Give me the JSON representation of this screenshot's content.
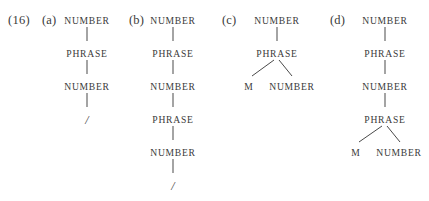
{
  "figure": {
    "example_number": "(16)",
    "background_color": "#ffffff",
    "text_color": "#3a3a3a",
    "line_color": "#4a4a4a",
    "node_labels": {
      "number": "NUMBER",
      "phrase": "PHRASE",
      "m": "M",
      "slash": "/"
    },
    "trees": [
      {
        "label": "(a)",
        "label_x": 42,
        "center_x": 87,
        "nodes": [
          {
            "text": "NUMBER",
            "x": 87,
            "y": 15,
            "type": "nonterminal"
          },
          {
            "text": "PHRASE",
            "x": 87,
            "y": 48,
            "type": "nonterminal"
          },
          {
            "text": "NUMBER",
            "x": 87,
            "y": 81,
            "type": "nonterminal"
          },
          {
            "text": "/",
            "x": 87,
            "y": 113,
            "type": "terminal-slash"
          }
        ],
        "edges": [
          {
            "x": 87,
            "y": 27,
            "height": 14
          },
          {
            "x": 87,
            "y": 60,
            "height": 14
          },
          {
            "x": 87,
            "y": 93,
            "height": 14
          }
        ],
        "branches": []
      },
      {
        "label": "(b)",
        "label_x": 129,
        "center_x": 173,
        "nodes": [
          {
            "text": "NUMBER",
            "x": 173,
            "y": 15,
            "type": "nonterminal"
          },
          {
            "text": "PHRASE",
            "x": 173,
            "y": 48,
            "type": "nonterminal"
          },
          {
            "text": "NUMBER",
            "x": 173,
            "y": 81,
            "type": "nonterminal"
          },
          {
            "text": "PHRASE",
            "x": 173,
            "y": 114,
            "type": "nonterminal"
          },
          {
            "text": "NUMBER",
            "x": 173,
            "y": 147,
            "type": "nonterminal"
          },
          {
            "text": "/",
            "x": 173,
            "y": 179,
            "type": "terminal-slash"
          }
        ],
        "edges": [
          {
            "x": 173,
            "y": 27,
            "height": 14
          },
          {
            "x": 173,
            "y": 60,
            "height": 14
          },
          {
            "x": 173,
            "y": 93,
            "height": 14
          },
          {
            "x": 173,
            "y": 126,
            "height": 14
          },
          {
            "x": 173,
            "y": 159,
            "height": 14
          }
        ],
        "branches": []
      },
      {
        "label": "(c)",
        "label_x": 222,
        "center_x": 277,
        "nodes": [
          {
            "text": "NUMBER",
            "x": 277,
            "y": 15,
            "type": "nonterminal"
          },
          {
            "text": "PHRASE",
            "x": 277,
            "y": 48,
            "type": "nonterminal"
          },
          {
            "text": "M",
            "x": 249,
            "y": 81,
            "type": "terminal-m"
          },
          {
            "text": "NUMBER",
            "x": 292,
            "y": 81,
            "type": "nonterminal"
          }
        ],
        "edges": [
          {
            "x": 277,
            "y": 27,
            "height": 14
          }
        ],
        "branches": [
          {
            "x1": 274,
            "y1": 60,
            "x2": 252,
            "y2": 76
          },
          {
            "x1": 279,
            "y1": 60,
            "x2": 292,
            "y2": 76
          }
        ]
      },
      {
        "label": "(d)",
        "label_x": 330,
        "center_x": 385,
        "nodes": [
          {
            "text": "NUMBER",
            "x": 385,
            "y": 15,
            "type": "nonterminal"
          },
          {
            "text": "PHRASE",
            "x": 385,
            "y": 48,
            "type": "nonterminal"
          },
          {
            "text": "NUMBER",
            "x": 385,
            "y": 81,
            "type": "nonterminal"
          },
          {
            "text": "PHRASE",
            "x": 385,
            "y": 114,
            "type": "nonterminal"
          },
          {
            "text": "M",
            "x": 356,
            "y": 147,
            "type": "terminal-m"
          },
          {
            "text": "NUMBER",
            "x": 399,
            "y": 147,
            "type": "nonterminal"
          }
        ],
        "edges": [
          {
            "x": 385,
            "y": 27,
            "height": 14
          },
          {
            "x": 385,
            "y": 60,
            "height": 14
          },
          {
            "x": 385,
            "y": 93,
            "height": 14
          }
        ],
        "branches": [
          {
            "x1": 382,
            "y1": 126,
            "x2": 359,
            "y2": 142
          },
          {
            "x1": 387,
            "y1": 126,
            "x2": 400,
            "y2": 142
          }
        ]
      }
    ]
  }
}
